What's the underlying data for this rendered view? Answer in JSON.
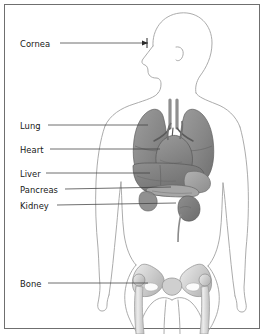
{
  "figure": {
    "view": "anterior torso silhouette with lateral head profile",
    "background_color": "#ffffff",
    "border_color": "#6f6f6f",
    "outline_color": "#9a9a9a",
    "leader_line_color": "#4a4a4a",
    "text_color": "#171717",
    "organ_fill_dark": "#7d7d7d",
    "organ_fill_mid": "#9b9b9b",
    "organ_fill_light": "#c4c4c4",
    "bone_fill": "#d9d9d9"
  },
  "labels": [
    {
      "id": "cornea",
      "text": "Cornea",
      "x": 20,
      "y": 39,
      "leader_x1": 60,
      "leader_y1": 43,
      "leader_x2": 148,
      "leader_y2": 43,
      "arrow": true
    },
    {
      "id": "lung",
      "text": "Lung",
      "x": 20,
      "y": 121,
      "leader_x1": 48,
      "leader_y1": 125,
      "leader_x2": 148,
      "leader_y2": 125,
      "arrow": false
    },
    {
      "id": "heart",
      "text": "Heart",
      "x": 20,
      "y": 145,
      "leader_x1": 50,
      "leader_y1": 149,
      "leader_x2": 160,
      "leader_y2": 149,
      "arrow": false
    },
    {
      "id": "liver",
      "text": "Liver",
      "x": 20,
      "y": 169,
      "leader_x1": 46,
      "leader_y1": 173,
      "leader_x2": 150,
      "leader_y2": 173,
      "arrow": false
    },
    {
      "id": "pancreas",
      "text": "Pancreas",
      "x": 20,
      "y": 185,
      "leader_x1": 65,
      "leader_y1": 189,
      "leader_x2": 171,
      "leader_y2": 187,
      "arrow": false
    },
    {
      "id": "kidney",
      "text": "Kidney",
      "x": 20,
      "y": 201,
      "leader_x1": 57,
      "leader_y1": 205,
      "leader_x2": 176,
      "leader_y2": 203,
      "arrow": false
    },
    {
      "id": "bone",
      "text": "Bone",
      "x": 20,
      "y": 279,
      "leader_x1": 48,
      "leader_y1": 283,
      "leader_x2": 148,
      "leader_y2": 283,
      "arrow": false
    }
  ],
  "organs": [
    {
      "id": "lung-right",
      "name": "Lung",
      "region": "thorax"
    },
    {
      "id": "lung-left",
      "name": "Lung",
      "region": "thorax"
    },
    {
      "id": "trachea",
      "name": "Trachea",
      "region": "thorax"
    },
    {
      "id": "heart",
      "name": "Heart",
      "region": "thorax"
    },
    {
      "id": "liver",
      "name": "Liver",
      "region": "abdomen"
    },
    {
      "id": "stomach",
      "name": "Stomach",
      "region": "abdomen"
    },
    {
      "id": "pancreas",
      "name": "Pancreas",
      "region": "abdomen"
    },
    {
      "id": "kidney",
      "name": "Kidney",
      "region": "abdomen"
    },
    {
      "id": "ureter",
      "name": "Ureter",
      "region": "abdomen"
    },
    {
      "id": "pelvis",
      "name": "Bone",
      "region": "pelvis"
    },
    {
      "id": "femur-left",
      "name": "Bone",
      "region": "leg"
    },
    {
      "id": "femur-right",
      "name": "Bone",
      "region": "leg"
    }
  ]
}
